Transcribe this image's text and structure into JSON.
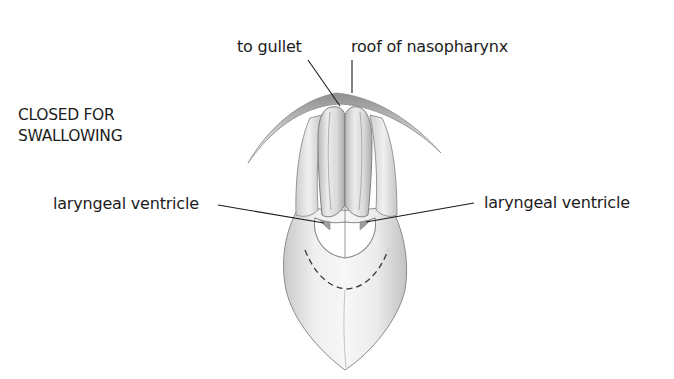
{
  "diagram": {
    "type": "anatomical-illustration",
    "state_label": {
      "line1": "CLOSED FOR",
      "line2": "SWALLOWING"
    },
    "labels": {
      "to_gullet": "to gullet",
      "roof_of_nasopharynx": "roof of nasopharynx",
      "laryngeal_ventricle_left": "laryngeal ventricle",
      "laryngeal_ventricle_right": "laryngeal ventricle"
    },
    "colors": {
      "background": "#ffffff",
      "text": "#1c1c1c",
      "leader_line": "#1a1a1a",
      "outline": "#8a8a8a",
      "shade_dark": "#9a9a9a",
      "shade_light": "#e6e6e6"
    }
  }
}
